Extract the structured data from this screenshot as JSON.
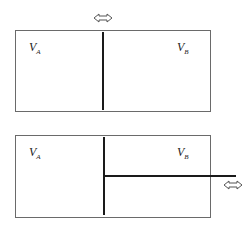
{
  "top_diagram": {
    "label_a": "V",
    "label_a_sub": "A",
    "label_b": "V",
    "label_b_sub": "B",
    "arrow": "double-arrow-horizontal"
  },
  "bottom_diagram": {
    "label_a": "V",
    "label_a_sub": "A",
    "label_b": "V",
    "label_b_sub": "B",
    "arrow": "double-arrow-horizontal"
  }
}
